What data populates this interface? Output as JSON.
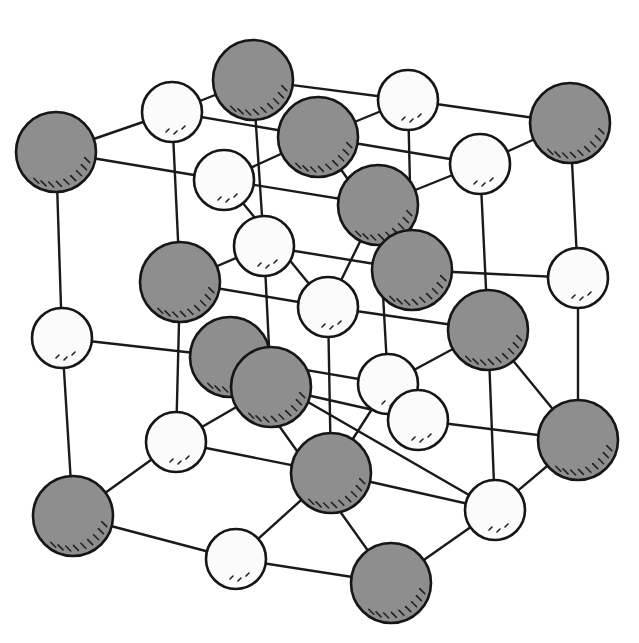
{
  "figure": {
    "colors": {
      "large_ion_fill": "#8e8e8e",
      "small_ion_fill": "#fbfbfb",
      "outline": "#161616",
      "bond": "#1a1a1a",
      "background": "#ffffff"
    },
    "ion_types": {
      "large": {
        "radius": 40,
        "shading": "hatched lower-right"
      },
      "small": {
        "radius": 30,
        "shading": "dotted lower-right"
      }
    },
    "ions": [
      {
        "id": "L1",
        "type": "large",
        "x": 253,
        "y": 80
      },
      {
        "id": "S1",
        "type": "small",
        "x": 172,
        "y": 112
      },
      {
        "id": "S2",
        "type": "small",
        "x": 408,
        "y": 100
      },
      {
        "id": "L2",
        "type": "large",
        "x": 570,
        "y": 123
      },
      {
        "id": "L3",
        "type": "large",
        "x": 56,
        "y": 152
      },
      {
        "id": "L4",
        "type": "large",
        "x": 318,
        "y": 137
      },
      {
        "id": "S3",
        "type": "small",
        "x": 224,
        "y": 180
      },
      {
        "id": "S4",
        "type": "small",
        "x": 480,
        "y": 164
      },
      {
        "id": "L5",
        "type": "large",
        "x": 378,
        "y": 205
      },
      {
        "id": "S5",
        "type": "small",
        "x": 264,
        "y": 246
      },
      {
        "id": "L6",
        "type": "large",
        "x": 180,
        "y": 282
      },
      {
        "id": "L7",
        "type": "large",
        "x": 412,
        "y": 270
      },
      {
        "id": "S6",
        "type": "small",
        "x": 578,
        "y": 278
      },
      {
        "id": "S7",
        "type": "small",
        "x": 328,
        "y": 307
      },
      {
        "id": "S8",
        "type": "small",
        "x": 62,
        "y": 338
      },
      {
        "id": "L8",
        "type": "large",
        "x": 488,
        "y": 330
      },
      {
        "id": "L9",
        "type": "large",
        "x": 271,
        "y": 387
      },
      {
        "id": "L10",
        "type": "large",
        "x": 230,
        "y": 357
      },
      {
        "id": "S9",
        "type": "small",
        "x": 418,
        "y": 420
      },
      {
        "id": "S10",
        "type": "small",
        "x": 388,
        "y": 384
      },
      {
        "id": "S11",
        "type": "small",
        "x": 176,
        "y": 442
      },
      {
        "id": "L11",
        "type": "large",
        "x": 578,
        "y": 440
      },
      {
        "id": "L12",
        "type": "large",
        "x": 331,
        "y": 473
      },
      {
        "id": "S12",
        "type": "small",
        "x": 495,
        "y": 510
      },
      {
        "id": "L13",
        "type": "large",
        "x": 73,
        "y": 516
      },
      {
        "id": "S13",
        "type": "small",
        "x": 236,
        "y": 559
      },
      {
        "id": "L14",
        "type": "large",
        "x": 391,
        "y": 583
      }
    ],
    "bonds": [
      [
        "L3",
        "S1"
      ],
      [
        "S1",
        "L1"
      ],
      [
        "L1",
        "S2"
      ],
      [
        "S2",
        "L2"
      ],
      [
        "L3",
        "S3"
      ],
      [
        "S1",
        "L4"
      ],
      [
        "L4",
        "S4"
      ],
      [
        "S2",
        "L4"
      ],
      [
        "S4",
        "L2"
      ],
      [
        "S3",
        "L4"
      ],
      [
        "S3",
        "L5"
      ],
      [
        "L5",
        "S4"
      ],
      [
        "L3",
        "S8"
      ],
      [
        "S1",
        "L6"
      ],
      [
        "S3",
        "S7"
      ],
      [
        "L1",
        "S5"
      ],
      [
        "L4",
        "L7"
      ],
      [
        "S2",
        "L7"
      ],
      [
        "L5",
        "S10"
      ],
      [
        "L2",
        "S6"
      ],
      [
        "S4",
        "L8"
      ],
      [
        "S8",
        "L10"
      ],
      [
        "L6",
        "S5"
      ],
      [
        "S5",
        "L7"
      ],
      [
        "L6",
        "S7"
      ],
      [
        "S7",
        "L8"
      ],
      [
        "L7",
        "S6"
      ],
      [
        "S7",
        "L5"
      ],
      [
        "L10",
        "S10"
      ],
      [
        "L9",
        "S9"
      ],
      [
        "S10",
        "L8"
      ],
      [
        "S9",
        "L11"
      ],
      [
        "L8",
        "L11"
      ],
      [
        "S8",
        "L13"
      ],
      [
        "L6",
        "S11"
      ],
      [
        "L10",
        "S12"
      ],
      [
        "S7",
        "L12"
      ],
      [
        "L8",
        "S12"
      ],
      [
        "S6",
        "L11"
      ],
      [
        "S11",
        "L9"
      ],
      [
        "L13",
        "S11"
      ],
      [
        "L13",
        "S13"
      ],
      [
        "S13",
        "L12"
      ],
      [
        "L12",
        "S12"
      ],
      [
        "S11",
        "L12"
      ],
      [
        "S12",
        "L11"
      ],
      [
        "L10",
        "L14"
      ],
      [
        "S13",
        "L14"
      ],
      [
        "L14",
        "S12"
      ],
      [
        "S5",
        "L9"
      ],
      [
        "L12",
        "S10"
      ],
      [
        "S10",
        "S9"
      ]
    ]
  }
}
